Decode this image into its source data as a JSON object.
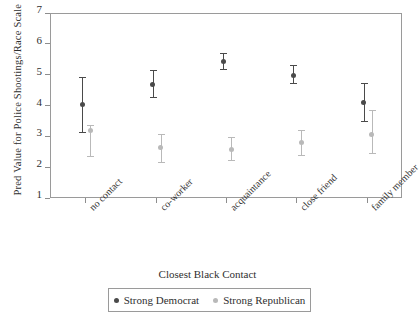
{
  "chart_data": {
    "type": "scatter",
    "title": "",
    "xlabel": "Closest Black Contact",
    "ylabel": "Pred Value for Police Shootings/Race Scale",
    "categories": [
      "no contact",
      "co-worker",
      "acquaintance",
      "close friend",
      "family member"
    ],
    "ylim": [
      1,
      7
    ],
    "yticks": [
      "1",
      "2",
      "3",
      "4",
      "5",
      "6",
      "7"
    ],
    "grid": false,
    "legend_position": "bottom",
    "series": [
      {
        "name": "Strong Democrat",
        "color": "#4a4a4a",
        "values": [
          4.05,
          4.72,
          5.45,
          5.02,
          4.12
        ],
        "ci_low": [
          3.15,
          4.28,
          5.18,
          4.72,
          3.5
        ],
        "ci_high": [
          4.97,
          5.18,
          5.73,
          5.33,
          4.75
        ]
      },
      {
        "name": "Strong Republican",
        "color": "#b9b9b9",
        "values": [
          3.22,
          2.66,
          2.62,
          2.83,
          3.1
        ],
        "ci_low": [
          2.35,
          2.18,
          2.22,
          2.4,
          2.45
        ],
        "ci_high": [
          3.4,
          3.12,
          3.02,
          3.25,
          3.9
        ]
      }
    ]
  },
  "legend": {
    "items": [
      {
        "label": "Strong Democrat"
      },
      {
        "label": "Strong Republican"
      }
    ]
  }
}
